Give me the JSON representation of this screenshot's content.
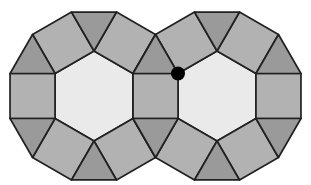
{
  "figure": {
    "colors": {
      "background": "#ffffff",
      "hexagon_fill": "#eaeaea",
      "square_fill": "#b2b2b2",
      "triangle_fill": "#9a9a9a",
      "outline": "#212121",
      "dot_fill": "#000000"
    },
    "geometry": {
      "edge_length": 45,
      "rosette_centers": [
        [
          94,
          96
        ],
        [
          217,
          96
        ]
      ],
      "stroke_width": 1.7,
      "dot": {
        "cx": 178,
        "cy": 73.5,
        "radius": 7
      }
    }
  }
}
